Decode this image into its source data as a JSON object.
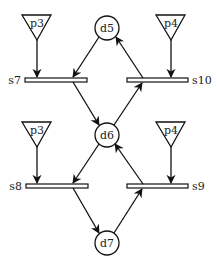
{
  "diagram": {
    "type": "petri-net",
    "stroke_color": "#111111",
    "background": "#ffffff",
    "places": [
      {
        "id": "d5",
        "label": "d5",
        "cx": 107,
        "cy": 28
      },
      {
        "id": "d6",
        "label": "d6",
        "cx": 107,
        "cy": 135
      },
      {
        "id": "d7",
        "label": "d7",
        "cx": 107,
        "cy": 243
      }
    ],
    "inputs": [
      {
        "id": "p3-top",
        "label": "p3"
      },
      {
        "id": "p4-top",
        "label": "p4"
      },
      {
        "id": "p3-bottom",
        "label": "p3"
      },
      {
        "id": "p4-bottom",
        "label": "p4"
      }
    ],
    "transitions": [
      {
        "id": "s7",
        "label": "s7"
      },
      {
        "id": "s10",
        "label": "s10"
      },
      {
        "id": "s8",
        "label": "s8"
      },
      {
        "id": "s9",
        "label": "s9"
      }
    ],
    "arcs": [
      {
        "from": "p3",
        "to": "s7"
      },
      {
        "from": "d5",
        "to": "s7"
      },
      {
        "from": "s7",
        "to": "d6"
      },
      {
        "from": "p4",
        "to": "s10"
      },
      {
        "from": "s10",
        "to": "d5"
      },
      {
        "from": "d6",
        "to": "s10"
      },
      {
        "from": "p3",
        "to": "s8"
      },
      {
        "from": "d6",
        "to": "s8"
      },
      {
        "from": "s8",
        "to": "d7"
      },
      {
        "from": "p4",
        "to": "s9"
      },
      {
        "from": "s9",
        "to": "d6"
      },
      {
        "from": "d7",
        "to": "s9"
      }
    ]
  }
}
